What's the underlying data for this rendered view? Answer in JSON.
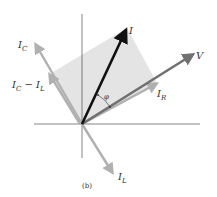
{
  "diagram": {
    "caption": "(b)",
    "colors": {
      "current_total": "#111111",
      "voltage": "#707070",
      "components": "#b0b0b0",
      "shade": "#e4e4e4",
      "axes": "#333333"
    },
    "vectors": [
      {
        "id": "I",
        "label": "I",
        "sub": ""
      },
      {
        "id": "V",
        "label": "V",
        "sub": ""
      },
      {
        "id": "IR",
        "label": "I",
        "sub": "R"
      },
      {
        "id": "IC",
        "label": "I",
        "sub": "C"
      },
      {
        "id": "ICmIL",
        "label": "I",
        "sub": "C",
        "mid": " − I",
        "sub2": "L"
      },
      {
        "id": "IL",
        "label": "I",
        "sub": "L"
      }
    ],
    "angle_label": "φ"
  }
}
